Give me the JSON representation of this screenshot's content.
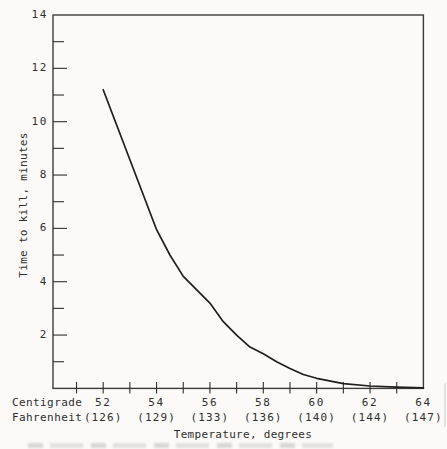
{
  "figure": {
    "background": "#fbfaf8",
    "ink": "#2f2f2f",
    "curve_color": "#1f1f1f"
  },
  "chart_data": {
    "type": "line",
    "title": "",
    "xlabel": "Temperature, degrees",
    "ylabel": "Time to kill, minutes",
    "grid": false,
    "legend": null,
    "x_axis_unit_rows": [
      "Centigrade",
      "Fahrenheit"
    ],
    "x_major_ticks": [
      {
        "deg": 52,
        "centigrade_label": "52",
        "fahrenheit_label": "(126)"
      },
      {
        "deg": 54,
        "centigrade_label": "54",
        "fahrenheit_label": "(129)"
      },
      {
        "deg": 56,
        "centigrade_label": "56",
        "fahrenheit_label": "(133)"
      },
      {
        "deg": 58,
        "centigrade_label": "58",
        "fahrenheit_label": "(136)"
      },
      {
        "deg": 60,
        "centigrade_label": "60",
        "fahrenheit_label": "(140)"
      },
      {
        "deg": 62,
        "centigrade_label": "62",
        "fahrenheit_label": "(144)"
      },
      {
        "deg": 64,
        "centigrade_label": "64",
        "fahrenheit_label": "(147)"
      }
    ],
    "x_minor_tick_degs": [
      51,
      53,
      55,
      57,
      59,
      61,
      63
    ],
    "y_major_ticks": [
      2,
      4,
      6,
      8,
      10,
      12,
      14
    ],
    "y_minor_ticks": [
      1,
      3,
      5,
      7,
      9,
      11,
      13
    ],
    "ylim": [
      0,
      14
    ],
    "xlim_deg": [
      50.1,
      64
    ],
    "series": [
      {
        "name": "time-to-kill-vs-temperature",
        "points_deg_minutes": [
          [
            52,
            11.2
          ],
          [
            54,
            5.95
          ],
          [
            54.5,
            5.0
          ],
          [
            55,
            4.2
          ],
          [
            56,
            3.2
          ],
          [
            56.5,
            2.5
          ],
          [
            57,
            2.0
          ],
          [
            57.5,
            1.55
          ],
          [
            58,
            1.3
          ],
          [
            58.5,
            1.0
          ],
          [
            59,
            0.75
          ],
          [
            59.5,
            0.52
          ],
          [
            60,
            0.38
          ],
          [
            61,
            0.18
          ],
          [
            62,
            0.09
          ],
          [
            63,
            0.05
          ],
          [
            64,
            0.02
          ]
        ]
      }
    ]
  }
}
